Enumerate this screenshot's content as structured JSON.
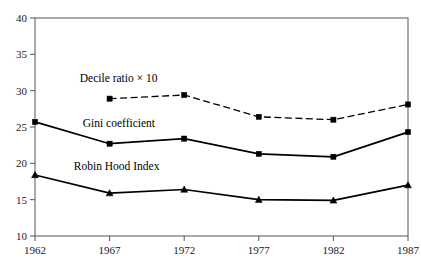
{
  "chart_data": {
    "type": "line",
    "title": "",
    "subtitle": "",
    "xlabel": "",
    "ylabel": "",
    "categories": [
      "1962",
      "1967",
      "1972",
      "1977",
      "1982",
      "1987"
    ],
    "x": [
      1962,
      1967,
      1972,
      1977,
      1982,
      1987
    ],
    "xlim": [
      1962,
      1987
    ],
    "ylim": [
      10,
      40
    ],
    "yticks": [
      "40",
      "35",
      "30",
      "25",
      "20",
      "15",
      "10"
    ],
    "ytick_values": [
      40,
      35,
      30,
      25,
      20,
      15,
      10
    ],
    "xticks": [
      "1962",
      "1967",
      "1972",
      "1977",
      "1982",
      "1987"
    ],
    "grid": false,
    "legend_position": "inline-annotations",
    "series": [
      {
        "name": "Decile ratio × 10",
        "values": [
          null,
          28.9,
          29.4,
          26.4,
          26.0,
          28.1
        ],
        "line_style": "dashed",
        "marker": "square",
        "color": "#000000",
        "label_x": 1965.0,
        "label_y": 31.2
      },
      {
        "name": "Gini coefficient",
        "values": [
          25.7,
          22.7,
          23.4,
          21.3,
          20.9,
          24.3
        ],
        "line_style": "solid",
        "marker": "square",
        "color": "#000000",
        "label_x": 1965.2,
        "label_y": 25.0
      },
      {
        "name": "Robin Hood Index",
        "values": [
          18.4,
          15.9,
          16.4,
          15.0,
          14.9,
          17.0
        ],
        "line_style": "solid",
        "marker": "triangle",
        "color": "#000000",
        "label_x": 1964.6,
        "label_y": 19.1
      }
    ],
    "axis_color": "#555555",
    "plot_background": "#ffffff"
  }
}
